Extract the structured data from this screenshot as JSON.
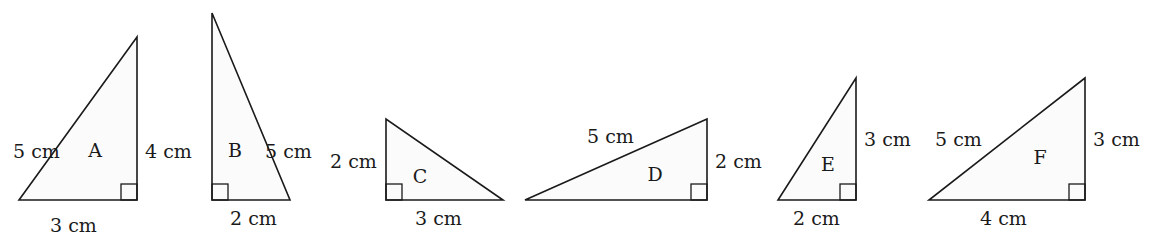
{
  "triangles": [
    {
      "name": "A",
      "points": [
        [
          19,
          200
        ],
        [
          137,
          200
        ],
        [
          137,
          37
        ]
      ],
      "right_angle": {
        "x": 121,
        "y": 184,
        "size": 16
      },
      "name_pos": [
        95,
        157
      ],
      "labels": [
        {
          "side": "hypotenuse",
          "text": "5 cm",
          "x": 13,
          "y": 158
        },
        {
          "side": "vertical",
          "text": "4 cm",
          "x": 145,
          "y": 158
        },
        {
          "side": "base",
          "text": "3 cm",
          "x": 50,
          "y": 232
        }
      ]
    },
    {
      "name": "B",
      "points": [
        [
          212,
          13
        ],
        [
          212,
          200
        ],
        [
          290,
          200
        ]
      ],
      "right_angle": {
        "x": 212,
        "y": 184,
        "size": 16
      },
      "name_pos": [
        235,
        157
      ],
      "labels": [
        {
          "side": "hypotenuse",
          "text": "5 cm",
          "x": 265,
          "y": 158
        },
        {
          "side": "base",
          "text": "2 cm",
          "x": 230,
          "y": 225
        }
      ]
    },
    {
      "name": "C",
      "points": [
        [
          386,
          119
        ],
        [
          386,
          200
        ],
        [
          503,
          200
        ]
      ],
      "right_angle": {
        "x": 386,
        "y": 184,
        "size": 16
      },
      "name_pos": [
        420,
        183
      ],
      "labels": [
        {
          "side": "vertical",
          "text": "2 cm",
          "x": 330,
          "y": 168
        },
        {
          "side": "base",
          "text": "3 cm",
          "x": 415,
          "y": 225
        }
      ]
    },
    {
      "name": "D",
      "points": [
        [
          525,
          200
        ],
        [
          707,
          200
        ],
        [
          707,
          119
        ]
      ],
      "right_angle": {
        "x": 691,
        "y": 184,
        "size": 16
      },
      "name_pos": [
        655,
        181
      ],
      "labels": [
        {
          "side": "hypotenuse",
          "text": "5 cm",
          "x": 587,
          "y": 143
        },
        {
          "side": "vertical",
          "text": "2 cm",
          "x": 715,
          "y": 168
        }
      ]
    },
    {
      "name": "E",
      "points": [
        [
          778,
          200
        ],
        [
          856,
          200
        ],
        [
          856,
          78
        ]
      ],
      "right_angle": {
        "x": 840,
        "y": 184,
        "size": 16
      },
      "name_pos": [
        828,
        171
      ],
      "labels": [
        {
          "side": "vertical",
          "text": "3 cm",
          "x": 864,
          "y": 146
        },
        {
          "side": "base",
          "text": "2 cm",
          "x": 793,
          "y": 225
        }
      ]
    },
    {
      "name": "F",
      "points": [
        [
          929,
          200
        ],
        [
          1085,
          200
        ],
        [
          1085,
          78
        ]
      ],
      "right_angle": {
        "x": 1069,
        "y": 184,
        "size": 16
      },
      "name_pos": [
        1040,
        164
      ],
      "labels": [
        {
          "side": "hypotenuse",
          "text": "5 cm",
          "x": 935,
          "y": 146
        },
        {
          "side": "vertical",
          "text": "3 cm",
          "x": 1093,
          "y": 146
        },
        {
          "side": "base",
          "text": "4 cm",
          "x": 980,
          "y": 225
        }
      ]
    }
  ],
  "colors": {
    "stroke": "#1a1a1a",
    "fill": "#fbfbfb",
    "background": "#ffffff"
  }
}
